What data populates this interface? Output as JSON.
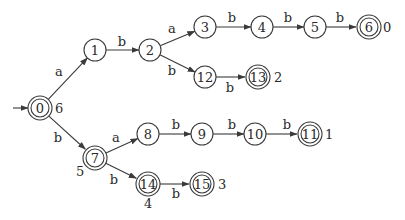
{
  "diagram": {
    "type": "finite-automaton",
    "colors": {
      "stroke": "#3a3a3a",
      "text": "#2a2a2a",
      "background": "#ffffff"
    },
    "start_state": "0",
    "nodes": [
      {
        "id": "0",
        "label": "0",
        "x": 40,
        "y": 108,
        "accepting": true,
        "annotation": "6",
        "ann_dx": 15,
        "ann_dy": 5
      },
      {
        "id": "1",
        "label": "1",
        "x": 95,
        "y": 50,
        "accepting": false
      },
      {
        "id": "2",
        "label": "2",
        "x": 150,
        "y": 50,
        "accepting": false
      },
      {
        "id": "3",
        "label": "3",
        "x": 205,
        "y": 27,
        "accepting": false
      },
      {
        "id": "4",
        "label": "4",
        "x": 262,
        "y": 27,
        "accepting": false
      },
      {
        "id": "5",
        "label": "5",
        "x": 315,
        "y": 27,
        "accepting": false
      },
      {
        "id": "6",
        "label": "6",
        "x": 369,
        "y": 27,
        "accepting": true,
        "annotation": "0",
        "ann_dx": 14,
        "ann_dy": 5
      },
      {
        "id": "12",
        "label": "12",
        "x": 205,
        "y": 77,
        "accepting": false
      },
      {
        "id": "13",
        "label": "13",
        "x": 258,
        "y": 77,
        "accepting": true,
        "annotation": "2",
        "ann_dx": 16,
        "ann_dy": 5
      },
      {
        "id": "7",
        "label": "7",
        "x": 95,
        "y": 158,
        "accepting": true,
        "annotation": "5",
        "ann_dx": -19,
        "ann_dy": 18
      },
      {
        "id": "8",
        "label": "8",
        "x": 148,
        "y": 134,
        "accepting": false
      },
      {
        "id": "9",
        "label": "9",
        "x": 202,
        "y": 134,
        "accepting": false
      },
      {
        "id": "10",
        "label": "10",
        "x": 255,
        "y": 134,
        "accepting": false
      },
      {
        "id": "11",
        "label": "11",
        "x": 310,
        "y": 134,
        "accepting": true,
        "annotation": "1",
        "ann_dx": 15,
        "ann_dy": 5
      },
      {
        "id": "14",
        "label": "14",
        "x": 148,
        "y": 184,
        "accepting": true,
        "annotation": "4",
        "ann_dx": -4,
        "ann_dy": 24
      },
      {
        "id": "15",
        "label": "15",
        "x": 202,
        "y": 184,
        "accepting": true,
        "annotation": "3",
        "ann_dx": 16,
        "ann_dy": 5
      }
    ],
    "edges": [
      {
        "from": "0",
        "to": "1",
        "label": "a",
        "lx": 59,
        "ly": 76
      },
      {
        "from": "1",
        "to": "2",
        "label": "b",
        "lx": 122,
        "ly": 46
      },
      {
        "from": "2",
        "to": "3",
        "label": "a",
        "lx": 172,
        "ly": 33
      },
      {
        "from": "2",
        "to": "12",
        "label": "b",
        "lx": 172,
        "ly": 75
      },
      {
        "from": "3",
        "to": "4",
        "label": "b",
        "lx": 232,
        "ly": 22
      },
      {
        "from": "4",
        "to": "5",
        "label": "b",
        "lx": 288,
        "ly": 22
      },
      {
        "from": "5",
        "to": "6",
        "label": "b",
        "lx": 340,
        "ly": 22
      },
      {
        "from": "12",
        "to": "13",
        "label": "b",
        "lx": 230,
        "ly": 92
      },
      {
        "from": "0",
        "to": "7",
        "label": "b",
        "lx": 58,
        "ly": 142
      },
      {
        "from": "7",
        "to": "8",
        "label": "a",
        "lx": 116,
        "ly": 142
      },
      {
        "from": "7",
        "to": "14",
        "label": "b",
        "lx": 114,
        "ly": 184
      },
      {
        "from": "8",
        "to": "9",
        "label": "b",
        "lx": 176,
        "ly": 129
      },
      {
        "from": "9",
        "to": "10",
        "label": "b",
        "lx": 232,
        "ly": 129
      },
      {
        "from": "10",
        "to": "11",
        "label": "b",
        "lx": 287,
        "ly": 129
      },
      {
        "from": "14",
        "to": "15",
        "label": "b",
        "lx": 176,
        "ly": 198
      }
    ]
  }
}
